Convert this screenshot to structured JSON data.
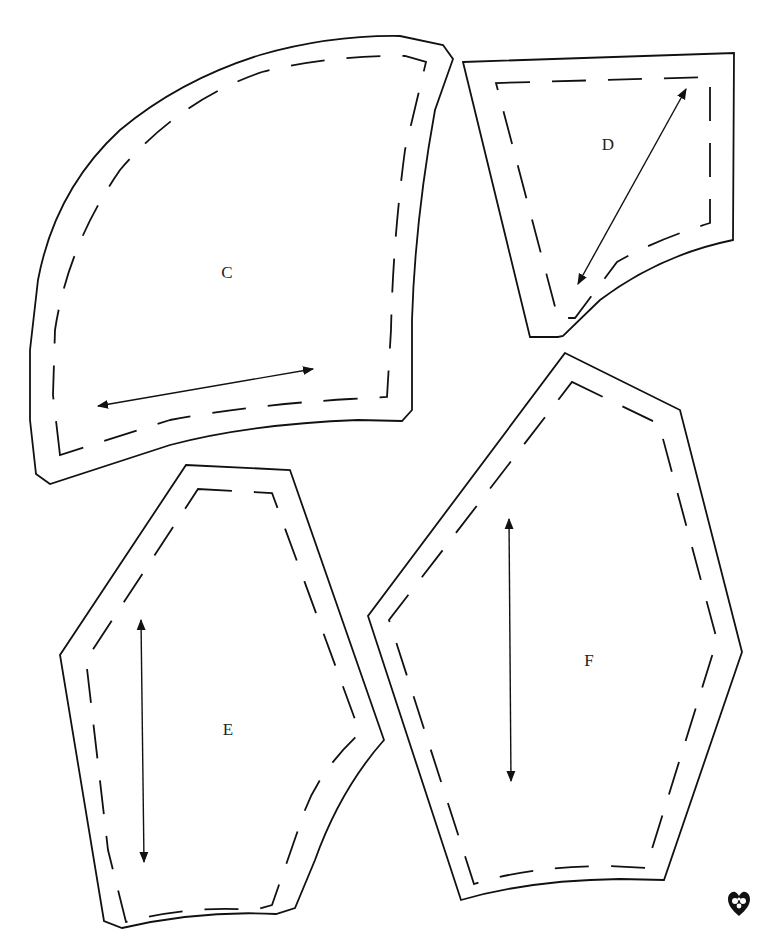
{
  "page": {
    "width": 761,
    "height": 940,
    "background": "#ffffff",
    "ink": "#111111"
  },
  "pieces": [
    {
      "id": "C",
      "label": "C",
      "label_pos": [
        227,
        278
      ],
      "cut_path": "M50,484 L36,474 L30,420 L30,350 L38,280 Q55,190 120,130 Q180,80 260,55 Q330,35 400,36 L443,45 L453,59 L435,110 Q415,220 412,320 L412,410 L402,421 L358,420 Q250,424 170,445 Z",
      "sew_path": "M60,455 L53,395 L55,330 Q68,245 120,170 Q180,100 262,72 Q330,55 405,56 L426,62 L405,150 Q393,240 391,330 L387,397 L350,399 Q250,405 170,420 Z",
      "grain": [
        [
          98,
          406
        ],
        [
          313,
          369
        ]
      ]
    },
    {
      "id": "D",
      "label": "D",
      "label_pos": [
        608,
        150
      ],
      "cut_path": "M463,62 L734,53 L733,240 Q660,255 600,300 L563,336 L558,337 L530,337 Z",
      "sew_path": "M496,83 L710,77 L710,223 Q655,240 617,262 L575,318 L558,318 L496,83 Z",
      "grain": [
        [
          686,
          89
        ],
        [
          578,
          284
        ]
      ]
    },
    {
      "id": "E",
      "label": "E",
      "label_pos": [
        228,
        735
      ],
      "cut_path": "M186,465 L290,470 L384,740 Q340,790 315,860 L295,908 L276,914 Q200,910 122,928 L104,921 L60,655 Z",
      "sew_path": "M198,489 L272,493 L360,733 Q320,770 305,810 L272,905 L255,910 Q190,905 126,922 L108,850 L86,660 Z",
      "grain": [
        [
          141,
          620
        ],
        [
          144,
          862
        ]
      ]
    },
    {
      "id": "F",
      "label": "F",
      "label_pos": [
        589,
        666
      ],
      "cut_path": "M565,353 L680,410 L742,652 L664,880 L620,879 Q530,880 461,900 L368,616 Z",
      "sew_path": "M572,382 L659,424 L717,640 L646,868 L610,866 Q530,866 474,884 L389,620 Z",
      "grain": [
        [
          509,
          519
        ],
        [
          511,
          781
        ]
      ]
    }
  ],
  "ornament": {
    "name": "heart-ornament",
    "glyph": "❦"
  }
}
